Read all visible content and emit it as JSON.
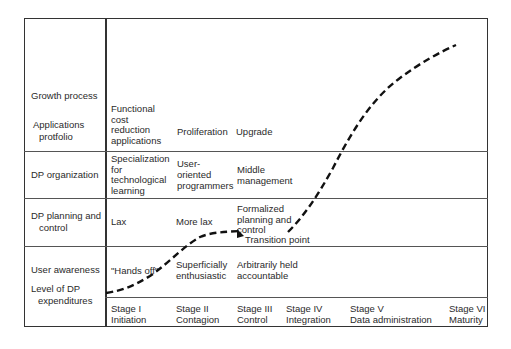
{
  "rows": {
    "growth_process": "Growth process",
    "applications_portfolio": [
      "Applications",
      "protfolio"
    ],
    "dp_organization": "DP organization",
    "dp_planning": [
      "DP planning and",
      "control"
    ],
    "user_awareness": "User awareness",
    "dp_expenditures": [
      "Level of DP",
      "expenditures"
    ]
  },
  "applications": {
    "stage1": [
      "Functional",
      "cost",
      "reduction",
      "applications"
    ],
    "stage2": "Proliferation",
    "stage3": "Upgrade"
  },
  "organization": {
    "stage1": [
      "Specialization",
      "for",
      "technological",
      "learning"
    ],
    "stage2": [
      "User-",
      "oriented",
      "programmers"
    ],
    "stage3": [
      "Middle",
      "management"
    ]
  },
  "planning": {
    "stage1": "Lax",
    "stage2": "More lax",
    "stage3": [
      "Formalized",
      "planning and",
      "control"
    ],
    "annotation": "Transition point"
  },
  "awareness": {
    "stage1": "\"Hands off\"",
    "stage2": [
      "Superficially",
      "enthusiastic"
    ],
    "stage3": [
      "Arbitrarily held",
      "accountable"
    ]
  },
  "stages": [
    {
      "num": "Stage I",
      "name": "Initiation"
    },
    {
      "num": "Stage II",
      "name": "Contagion"
    },
    {
      "num": "Stage III",
      "name": "Control"
    },
    {
      "num": "Stage IV",
      "name": "Integration"
    },
    {
      "num": "Stage V",
      "name": "Data administration"
    },
    {
      "num": "Stage VI",
      "name": "Maturity"
    }
  ]
}
